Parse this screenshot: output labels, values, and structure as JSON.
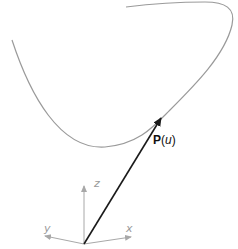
{
  "diagram": {
    "curve": {
      "name": "parametric-curve",
      "color": "#9a9a9a"
    },
    "vector": {
      "label_bold": "P",
      "label_open": "(",
      "label_param": "u",
      "label_close": ")",
      "color": "#1a1a1a"
    },
    "axes": {
      "color": "#a8a8a8",
      "x_label": "x",
      "y_label": "y",
      "z_label": "z"
    }
  }
}
